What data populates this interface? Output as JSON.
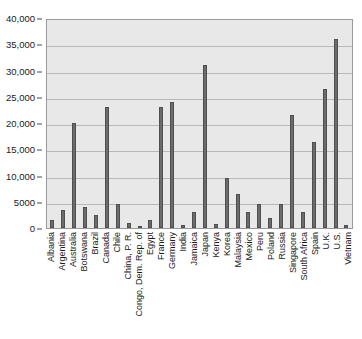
{
  "chart_data": {
    "type": "bar",
    "title": "",
    "subtitle": "",
    "xlabel": "",
    "ylabel": "",
    "ylim": [
      0,
      40000
    ],
    "ytick_labels": [
      "40,000",
      "35,000",
      "30,000",
      "25,000",
      "20,000",
      "15,000",
      "10,000",
      "5000",
      "0"
    ],
    "ytick_values": [
      40000,
      35000,
      30000,
      25000,
      20000,
      15000,
      10000,
      5000,
      0
    ],
    "grid": true,
    "legend": "none",
    "bar_color": "#6b6b6b",
    "plot_background": "#e8e8e8",
    "categories": [
      "Albania",
      "Argentina",
      "Australia",
      "Botswana",
      "Brazil",
      "Canada",
      "Chile",
      "China, P. R.",
      "Congo, Dem. Rep. of",
      "Egypt",
      "France",
      "Germany",
      "India",
      "Jamaica",
      "Japan",
      "Kenya",
      "Korea",
      "Malaysia",
      "Mexico",
      "Peru",
      "Poland",
      "Russia",
      "Singapore",
      "South Africa",
      "Spain",
      "U.K.",
      "U.S.",
      "Vietnam"
    ],
    "values": [
      1500,
      3500,
      20000,
      4000,
      2500,
      23000,
      4500,
      1000,
      300,
      1500,
      23000,
      24000,
      600,
      3000,
      31000,
      800,
      9500,
      6500,
      3000,
      4500,
      2000,
      4500,
      21500,
      3000,
      16300,
      26500,
      36000,
      600
    ]
  }
}
